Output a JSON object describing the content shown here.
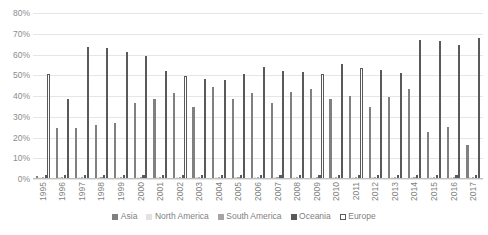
{
  "chart_data": {
    "type": "bar",
    "title": "",
    "subtitle": "",
    "xlabel": "",
    "ylabel": "",
    "grid": true,
    "legend_position": "bottom",
    "ylim": [
      0,
      80
    ],
    "ytick_labels": [
      "80%",
      "70%",
      "60%",
      "50%",
      "40%",
      "30%",
      "20%",
      "10%",
      "0%"
    ],
    "ytick_values": [
      80,
      70,
      60,
      50,
      40,
      30,
      20,
      10,
      0
    ],
    "categories": [
      "1995",
      "1996",
      "1997",
      "1998",
      "1999",
      "2000",
      "2001",
      "2002",
      "2003",
      "2004",
      "2005",
      "2006",
      "2007",
      "2008",
      "2009",
      "2010",
      "2011",
      "2012",
      "2013",
      "2014",
      "2015",
      "2016",
      "2017"
    ],
    "series": [
      {
        "name": "Asia",
        "color": "#808080",
        "values": [
          1.5,
          24.5,
          24.8,
          25.8,
          26.8,
          36.5,
          38.5,
          41.5,
          34.5,
          44.5,
          38.5,
          41.5,
          36.5,
          42.0,
          43.5,
          38.5,
          40.0,
          34.5,
          39.5,
          43.5,
          22.5,
          25.0,
          16.5
        ]
      },
      {
        "name": "North America",
        "color": "#e2e2e2",
        "values": [
          1.0,
          1.0,
          1.0,
          1.0,
          1.0,
          1.0,
          1.0,
          1.0,
          1.0,
          1.0,
          1.0,
          1.0,
          1.0,
          1.0,
          1.0,
          1.0,
          1.0,
          1.0,
          1.0,
          1.0,
          1.0,
          1.0,
          1.0
        ]
      },
      {
        "name": "South America",
        "color": "#a6a6a6",
        "values": [
          0.8,
          0.8,
          0.8,
          0.8,
          0.8,
          0.8,
          0.8,
          0.8,
          0.8,
          0.8,
          0.8,
          0.8,
          0.8,
          0.8,
          0.8,
          0.8,
          0.8,
          0.8,
          0.8,
          0.8,
          0.8,
          0.8,
          0.8
        ]
      },
      {
        "name": "Oceania",
        "color": "#595959",
        "values": [
          1.8,
          1.8,
          1.8,
          1.8,
          1.8,
          1.8,
          1.8,
          1.8,
          1.8,
          1.8,
          1.8,
          1.8,
          1.8,
          1.8,
          1.8,
          1.8,
          1.8,
          1.8,
          1.8,
          1.8,
          1.8,
          1.8,
          1.8
        ]
      },
      {
        "name": "Europe",
        "color": "#ffffff",
        "values": [
          50.5,
          38.5,
          63.5,
          63.0,
          61.0,
          59.5,
          52.0,
          49.5,
          48.0,
          47.5,
          50.5,
          54.0,
          52.0,
          51.5,
          50.5,
          55.5,
          53.5,
          52.5,
          51.0,
          67.0,
          66.5,
          64.5,
          68.0
        ]
      }
    ]
  },
  "legend": {
    "items": [
      {
        "label": "Asia"
      },
      {
        "label": "North America"
      },
      {
        "label": "South America"
      },
      {
        "label": "Oceania"
      },
      {
        "label": "Europe"
      }
    ]
  }
}
